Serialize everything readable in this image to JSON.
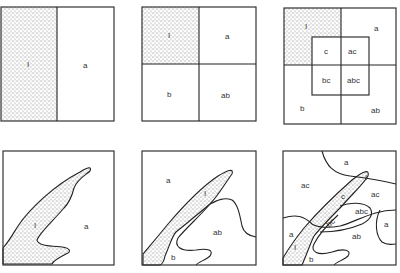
{
  "figure": {
    "fill_color": "#b8b8b8",
    "line_color": "#222222"
  },
  "panels": [
    {
      "id": "top-1",
      "labels": [
        "I",
        "a"
      ]
    },
    {
      "id": "top-2",
      "labels": [
        "I",
        "a",
        "b",
        "ab"
      ]
    },
    {
      "id": "top-3",
      "labels": [
        "I",
        "a",
        "c",
        "ac",
        "bc",
        "abc",
        "b",
        "ab"
      ]
    },
    {
      "id": "bottom-1",
      "labels": [
        "I",
        "a"
      ]
    },
    {
      "id": "bottom-2",
      "labels": [
        "a",
        "I",
        "ab",
        "b"
      ]
    },
    {
      "id": "bottom-3",
      "labels": [
        "a",
        "I",
        "ac",
        "c",
        "ac",
        "abc",
        "a",
        "bc",
        "a",
        "ab",
        "I",
        "b"
      ]
    }
  ]
}
